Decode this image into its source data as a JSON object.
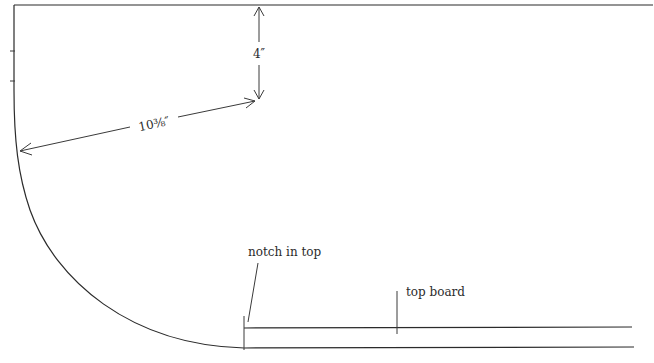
{
  "diagram": {
    "dimensions": {
      "vertical": {
        "label": "4″"
      },
      "radial": {
        "label": "10⅜″"
      }
    },
    "callouts": {
      "notch": {
        "label": "notch in top"
      },
      "top_board": {
        "label": "top board"
      }
    },
    "colors": {
      "line": "#2b2b2b",
      "background": "#ffffff"
    }
  }
}
